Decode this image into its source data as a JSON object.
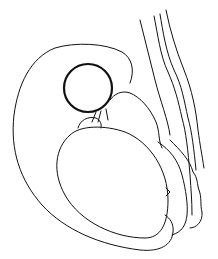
{
  "figure": {
    "type": "line-drawing",
    "stroke_color": "#111111",
    "background_color": "#ffffff",
    "text_labels": []
  }
}
